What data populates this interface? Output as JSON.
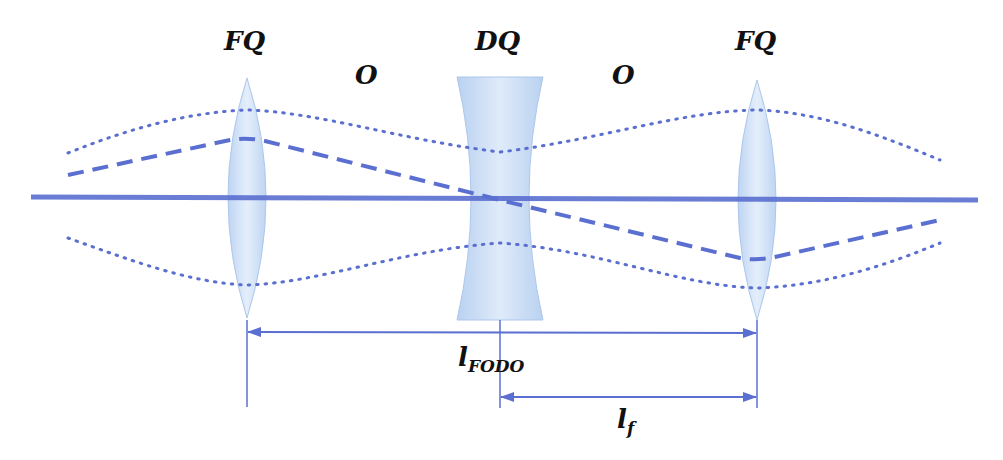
{
  "diagram": {
    "colors": {
      "line": "#5a6fd0",
      "lens_fill": "#c9dcf5",
      "lens_stroke": "#a9c4ec",
      "text": "#111111"
    },
    "labels": {
      "fq_left": "FQ",
      "dq": "DQ",
      "fq_right": "FQ",
      "drift_left": "O",
      "drift_right": "O",
      "l_fodo_main": "l",
      "l_fodo_sub": "FODO",
      "l_f_main": "l",
      "l_f_sub": "f"
    },
    "elements": [
      {
        "type": "focusing-quadrupole",
        "label": "FQ",
        "x": 247
      },
      {
        "type": "drift",
        "label": "O"
      },
      {
        "type": "defocusing-quadrupole",
        "label": "DQ",
        "x": 500
      },
      {
        "type": "drift",
        "label": "O"
      },
      {
        "type": "focusing-quadrupole",
        "label": "FQ",
        "x": 757
      }
    ],
    "dimensions": [
      {
        "name": "l_FODO",
        "from_x": 247,
        "to_x": 757
      },
      {
        "name": "l_f",
        "from_x": 500,
        "to_x": 757
      }
    ],
    "traces": [
      {
        "name": "beam-axis",
        "style": "solid"
      },
      {
        "name": "particle-trajectory",
        "style": "dashed"
      },
      {
        "name": "beam-envelope-upper",
        "style": "dotted"
      },
      {
        "name": "beam-envelope-lower",
        "style": "dotted"
      }
    ]
  }
}
